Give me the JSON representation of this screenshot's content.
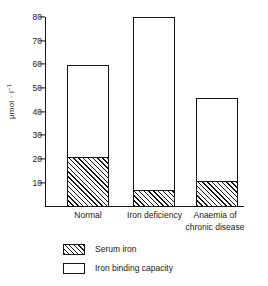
{
  "chart_data": {
    "type": "bar",
    "subtype": "stacked",
    "title": "",
    "xlabel": "",
    "ylabel": "µmol · l",
    "ylabel_exponent": "-1",
    "ylim": [
      0,
      80
    ],
    "yticks": [
      10,
      20,
      30,
      40,
      50,
      60,
      70,
      80
    ],
    "ytick_labels": [
      "10",
      "20",
      "30",
      "40",
      "50",
      "60",
      "70",
      "80"
    ],
    "grid": false,
    "legend_position": "below-axes-left",
    "categories": [
      "Normal",
      "Iron deficiency",
      "Anaemia of\nchronic disease"
    ],
    "series": [
      {
        "name": "Serum iron",
        "fill": "hatched",
        "values": [
          21,
          7,
          11
        ]
      },
      {
        "name": "Iron binding capacity",
        "fill": "white",
        "values": [
          39,
          73,
          35
        ]
      }
    ],
    "bar_totals": [
      60,
      80,
      46
    ],
    "colors": {
      "line": "#141414",
      "fill_white": "#ffffff",
      "hatch": "#141414",
      "background": "#ffffff"
    }
  },
  "legend": {
    "items": [
      {
        "label": "Serum iron",
        "swatch": "hatched"
      },
      {
        "label": "Iron binding capacity",
        "swatch": "white"
      }
    ]
  },
  "axis": {
    "y_title_main": "µmol · l",
    "y_title_sup": "−1",
    "tick_80": "80",
    "tick_70": "70",
    "tick_60": "60",
    "tick_50": "50",
    "tick_40": "40",
    "tick_30": "30",
    "tick_20": "20",
    "tick_10": "10"
  },
  "xcategories": {
    "cat0": "Normal",
    "cat1": "Iron deficiency",
    "cat2": "Anaemia of\nchronic disease"
  },
  "caption": {
    "ghost_line": ""
  }
}
